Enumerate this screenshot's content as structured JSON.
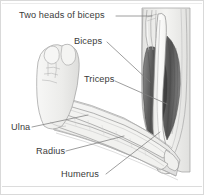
{
  "figure": {
    "name": "arm-anatomy-diagram",
    "background_color": "#ffffff",
    "border_color": "#d6d6d6",
    "line_color": "#6f6f6f",
    "leader_line_color": "#8a8a8a",
    "label_text_color": "#3b3b3b",
    "bone_fill_color": "#f2f2f0",
    "muscle_dark_color": "#5f5f5f",
    "muscle_mid_color": "#8d8d8d",
    "muscle_light_color": "#c9c9c9",
    "skin_outline_color": "#9a9a9a"
  },
  "labels": [
    {
      "id": "two-heads-of-biceps",
      "text": "Two heads of biceps"
    },
    {
      "id": "biceps",
      "text": "Biceps"
    },
    {
      "id": "triceps",
      "text": "Triceps"
    },
    {
      "id": "ulna",
      "text": "Ulna"
    },
    {
      "id": "radius",
      "text": "Radius"
    },
    {
      "id": "humerus",
      "text": "Humerus"
    }
  ],
  "structures": {
    "humerus": "upper arm bone, vertical, right side of figure",
    "ulna": "forearm bone, upper of the two parallel forearm bones",
    "radius": "forearm bone, lower of the two parallel forearm bones",
    "biceps": "muscle on the front of the upper arm, two heads at the shoulder",
    "triceps": "muscle on the back of the upper arm",
    "fist": "clenched hand at the left end of the forearm"
  }
}
